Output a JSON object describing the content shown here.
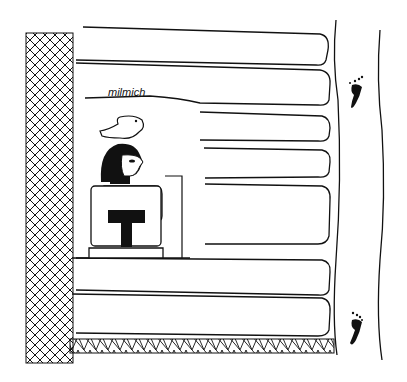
{
  "figure": {
    "type": "line-drawing",
    "label": "milmich",
    "elements": [
      "hatched-wall",
      "long-benches",
      "seated-figure",
      "bird-hieroglyph",
      "footprint-top",
      "footprint-bottom",
      "hatched-floor"
    ],
    "colors": {
      "ink": "#111111",
      "background": "#ffffff"
    }
  }
}
